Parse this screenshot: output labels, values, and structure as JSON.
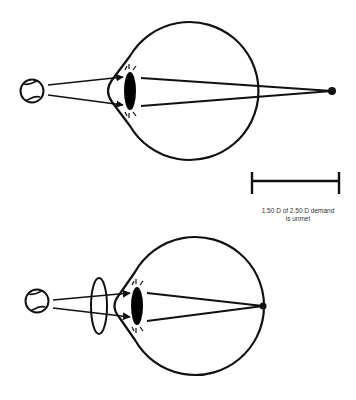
{
  "diagram": {
    "colors": {
      "stroke": "#111111",
      "background": "#ffffff",
      "text": "#333333"
    },
    "panels": [
      {
        "id": "top",
        "label": "uncorrected eye",
        "object": "baseball-icon",
        "focus": "behind-retina"
      },
      {
        "id": "bottom",
        "label": "corrected with lens",
        "object": "baseball-icon",
        "corrective_lens": true,
        "focus": "on-retina"
      }
    ],
    "scale_bar": {
      "caption_line1": "1.50 D of 2.50 D demand",
      "caption_line2": "is unmet"
    }
  }
}
